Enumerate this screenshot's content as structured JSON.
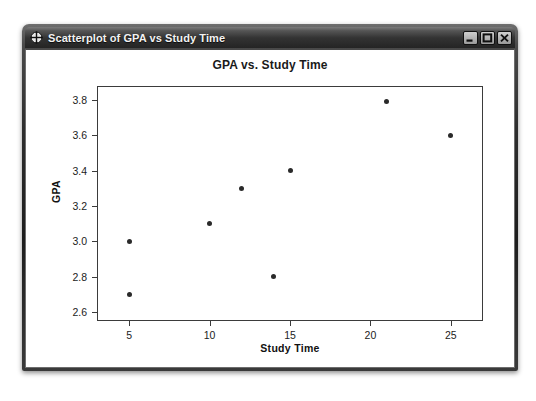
{
  "window": {
    "title": "Scatterplot of GPA vs Study Time",
    "icon": "crosshair-circle-icon",
    "buttons": {
      "minimize": "minimize-icon",
      "maximize": "maximize-icon",
      "close": "close-icon"
    }
  },
  "chart_data": {
    "type": "scatter",
    "title": "GPA vs. Study Time",
    "xlabel": "Study Time",
    "ylabel": "GPA",
    "xlim": [
      3,
      27
    ],
    "ylim": [
      2.55,
      3.88
    ],
    "xticks": [
      5,
      10,
      15,
      20,
      25
    ],
    "yticks": [
      "2.6",
      "2.8",
      "3.0",
      "3.2",
      "3.4",
      "3.6",
      "3.8"
    ],
    "grid": false,
    "legend": null,
    "marker_color": "#2a2a2a",
    "points": [
      {
        "x": 5,
        "y": 3.0
      },
      {
        "x": 5,
        "y": 2.7
      },
      {
        "x": 10,
        "y": 3.1
      },
      {
        "x": 12,
        "y": 3.3
      },
      {
        "x": 14,
        "y": 2.8
      },
      {
        "x": 15,
        "y": 3.4
      },
      {
        "x": 21,
        "y": 3.79
      },
      {
        "x": 25,
        "y": 3.6
      }
    ]
  }
}
